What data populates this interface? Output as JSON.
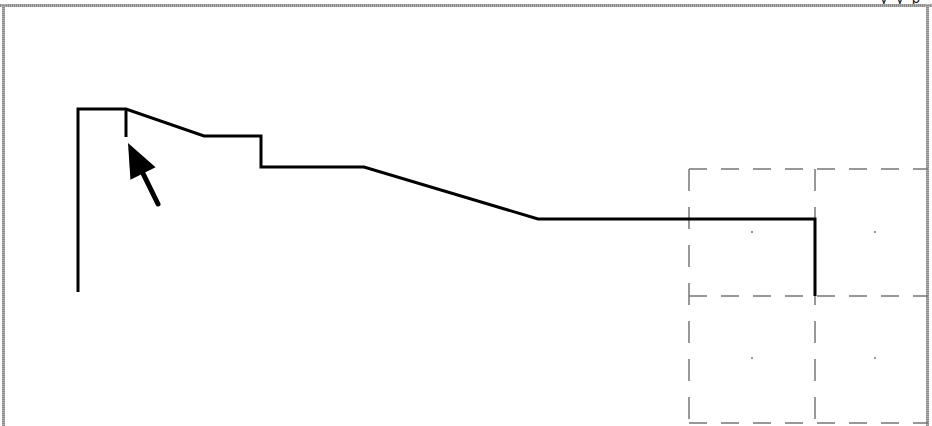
{
  "viewport": {
    "title_strip_partial_text": "y y p",
    "background": "#ffffff",
    "border_color": "#9a9a9a"
  },
  "profile": {
    "color": "#000000",
    "stroke_width": 3,
    "points": [
      [
        78,
        292
      ],
      [
        78,
        109
      ],
      [
        126,
        109
      ],
      [
        204,
        136
      ],
      [
        261,
        136
      ],
      [
        261,
        167
      ],
      [
        364,
        167
      ],
      [
        538,
        219
      ],
      [
        815,
        219
      ],
      [
        815,
        296
      ]
    ],
    "marker_tick": [
      [
        126,
        109
      ],
      [
        126,
        137
      ]
    ]
  },
  "pointer": {
    "name": "arrow-cursor",
    "color": "#000000",
    "tip": [
      128,
      143
    ],
    "tail": [
      158,
      204
    ]
  },
  "tool_grid": {
    "color": "#777777",
    "dash": "18 14",
    "x_lines": [
      689,
      815
    ],
    "y_lines": [
      169,
      296,
      423
    ],
    "x_start": 689,
    "x_end": 928,
    "y_start": 169,
    "y_end": 426,
    "center_dots": [
      [
        752,
        232
      ],
      [
        875,
        232
      ],
      [
        752,
        358
      ],
      [
        875,
        358
      ]
    ]
  }
}
